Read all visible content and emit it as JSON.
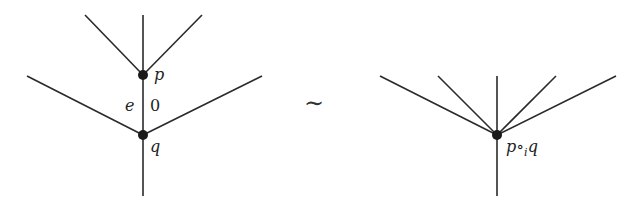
{
  "diagram": {
    "left_tree": {
      "nodes": [
        {
          "id": "p",
          "label": "p",
          "x": 143,
          "y": 75
        },
        {
          "id": "q",
          "label": "q",
          "x": 143,
          "y": 135
        }
      ],
      "internal_edge": {
        "from": "p",
        "to": "q",
        "left_label": "e",
        "right_label": "0"
      },
      "p_inputs": [
        [
          85,
          15
        ],
        [
          143,
          15
        ],
        [
          202,
          15
        ]
      ],
      "q_extra_inputs": [
        [
          27,
          76
        ],
        [
          262,
          76
        ]
      ],
      "root_end": [
        143,
        196
      ]
    },
    "relation_symbol": "∼",
    "right_tree": {
      "node": {
        "id": "pq",
        "label_main": "p∘",
        "label_sub": "i",
        "label_end": "q",
        "x": 497,
        "y": 135
      },
      "inputs": [
        [
          380,
          76
        ],
        [
          438,
          76
        ],
        [
          497,
          76
        ],
        [
          556,
          76
        ],
        [
          616,
          76
        ]
      ],
      "root_end": [
        497,
        196
      ]
    }
  }
}
